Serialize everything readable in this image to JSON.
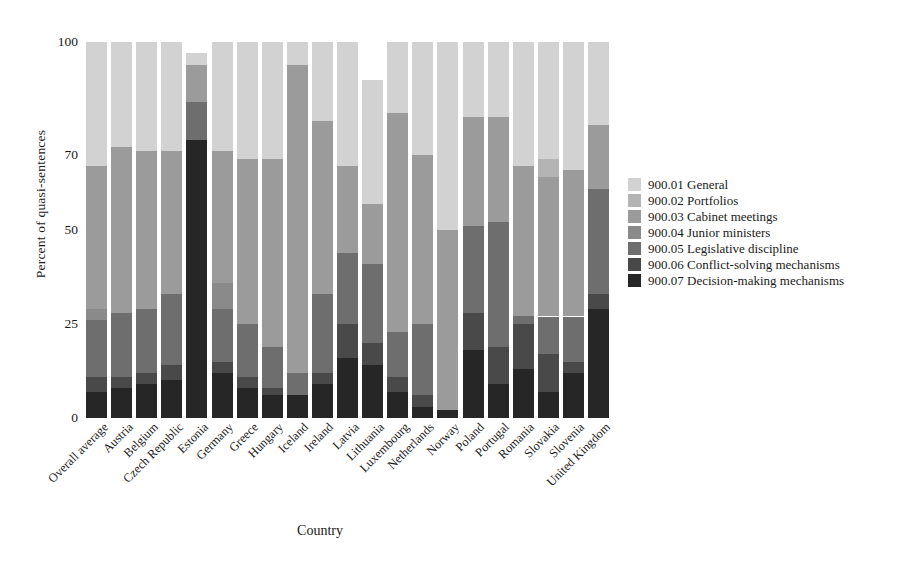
{
  "chart_data": {
    "type": "bar",
    "stacked": true,
    "title": "",
    "xlabel": "Country",
    "ylabel": "Percent of quasi-sentences",
    "ylim": [
      0,
      100
    ],
    "yticks": [
      0,
      25,
      50,
      70,
      100
    ],
    "grid": false,
    "legend_position": "right",
    "categories": [
      "Overall average",
      "Austria",
      "Belgium",
      "Czech Republic",
      "Estonia",
      "Germany",
      "Greece",
      "Hungary",
      "Iceland",
      "Ireland",
      "Latvia",
      "Lithuania",
      "Luxembourg",
      "Netherlands",
      "Norway",
      "Poland",
      "Portugal",
      "Romania",
      "Slovakia",
      "Slovenia",
      "United Kingdom"
    ],
    "series": [
      {
        "name": "900.01 General",
        "color": "#d2d2d2",
        "values": [
          33,
          28,
          29,
          29,
          3,
          29,
          31,
          31,
          6,
          21,
          33,
          33,
          19,
          30,
          50,
          20,
          20,
          33,
          31,
          34,
          22
        ]
      },
      {
        "name": "900.02 Portfolios",
        "color": "#b4b4b4",
        "values": [
          0,
          0,
          0,
          0,
          0,
          0,
          0,
          0,
          0,
          0,
          0,
          0,
          0,
          0,
          0,
          0,
          0,
          0,
          5,
          0,
          0
        ]
      },
      {
        "name": "900.03 Cabinet meetings",
        "color": "#9b9b9b",
        "values": [
          38,
          44,
          42,
          38,
          10,
          35,
          44,
          50,
          82,
          46,
          23,
          16,
          58,
          45,
          48,
          29,
          28,
          40,
          37,
          39,
          17
        ]
      },
      {
        "name": "900.04 Junior ministers",
        "color": "#8a8a8a",
        "values": [
          3,
          0,
          0,
          0,
          0,
          7,
          0,
          0,
          0,
          0,
          0,
          0,
          0,
          0,
          0,
          0,
          0,
          0,
          0,
          0,
          0
        ]
      },
      {
        "name": "900.05 Legislative discipline",
        "color": "#6e6e6e",
        "values": [
          15,
          17,
          17,
          19,
          10,
          14,
          14,
          11,
          6,
          21,
          19,
          21,
          12,
          19,
          0,
          23,
          33,
          2,
          10,
          12,
          28
        ]
      },
      {
        "name": "900.06 Conflict-solving mechanisms",
        "color": "#494949",
        "values": [
          4,
          3,
          3,
          4,
          0,
          3,
          3,
          2,
          0,
          3,
          9,
          6,
          4,
          3,
          0,
          10,
          10,
          12,
          10,
          3,
          4
        ]
      },
      {
        "name": "900.07 Decision-making mechanisms",
        "color": "#262626",
        "values": [
          7,
          8,
          9,
          10,
          74,
          12,
          8,
          6,
          6,
          9,
          16,
          14,
          7,
          3,
          2,
          18,
          9,
          13,
          7,
          12,
          29
        ]
      }
    ]
  },
  "legend": {
    "items": [
      {
        "label": "900.01 General",
        "color": "#d2d2d2"
      },
      {
        "label": "900.02 Portfolios",
        "color": "#b4b4b4"
      },
      {
        "label": "900.03 Cabinet meetings",
        "color": "#9b9b9b"
      },
      {
        "label": "900.04 Junior ministers",
        "color": "#8a8a8a"
      },
      {
        "label": "900.05 Legislative discipline",
        "color": "#6e6e6e"
      },
      {
        "label": "900.06 Conflict-solving mechanisms",
        "color": "#494949"
      },
      {
        "label": "900.07 Decision-making mechanisms",
        "color": "#262626"
      }
    ]
  }
}
